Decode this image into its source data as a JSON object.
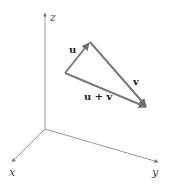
{
  "diagram": {
    "type": "3d-vector-addition",
    "axes": {
      "x_label": "x",
      "y_label": "y",
      "z_label": "z",
      "color": "#9a9a9a"
    },
    "vectors": [
      {
        "name": "u",
        "label": "u"
      },
      {
        "name": "v",
        "label": "v"
      },
      {
        "name": "sum",
        "label": "u + v"
      }
    ],
    "vector_color": "#7a7a7a"
  }
}
